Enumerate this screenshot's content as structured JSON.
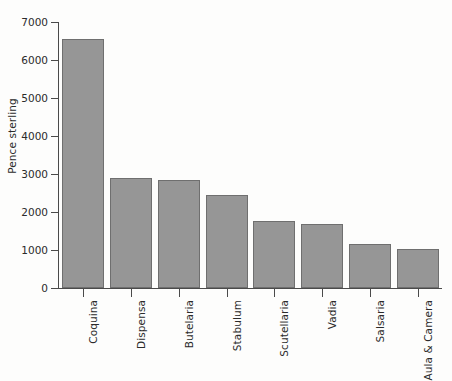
{
  "chart_data": {
    "type": "bar",
    "title": "",
    "subtitle": "",
    "xlabel": "",
    "ylabel": "Pence sterling",
    "categories": [
      "Coquina",
      "Dispensa",
      "Butelaria",
      "Stabulum",
      "Scutellaria",
      "Vadia",
      "Salsaria",
      "Aula & Camera"
    ],
    "values": [
      6560,
      2890,
      2830,
      2440,
      1770,
      1680,
      1170,
      1020
    ],
    "ylim": [
      0,
      7000
    ],
    "ytick_labels": [
      "0",
      "1000",
      "2000",
      "3000",
      "4000",
      "5000",
      "6000",
      "7000"
    ],
    "ytick_values": [
      0,
      1000,
      2000,
      3000,
      4000,
      5000,
      6000,
      7000
    ],
    "grid": false,
    "legend": null,
    "bar_color": "#969696",
    "bar_edge_color": "#6f6f6f",
    "axis_color": "#4a4a4a",
    "background_color": "#fdfdfc",
    "text_color": "#2b2b2b"
  }
}
